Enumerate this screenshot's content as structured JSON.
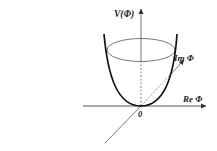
{
  "diagram": {
    "labels": {
      "v_axis": "V(Φ)",
      "im_axis": "Im Φ",
      "re_axis": "Re Φ",
      "origin": "0"
    },
    "colors": {
      "stroke": "#222222",
      "curve": "#111111",
      "background": "#ffffff"
    }
  }
}
